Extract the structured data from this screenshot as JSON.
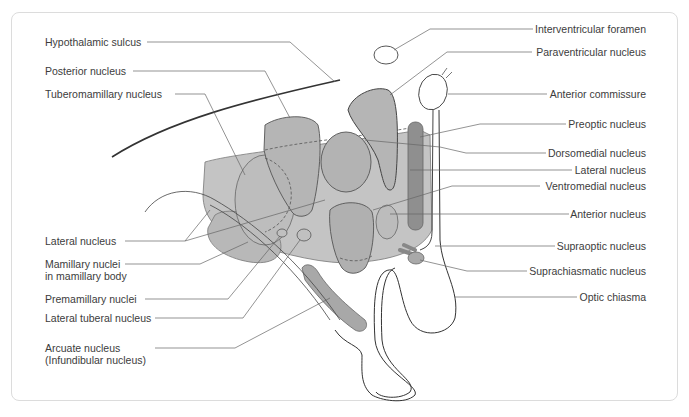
{
  "colors": {
    "background": "#ffffff",
    "frame_border": "#dcdcdc",
    "nucleus_fill": "#b5b5b5",
    "nucleus_fill_light": "#c4c4c4",
    "nucleus_dark": "#8a8a8a",
    "outline": "#4a4a4a",
    "leader_line": "#666666",
    "label_text": "#3c3c3c"
  },
  "labels_left": [
    {
      "id": "hypothalamic-sulcus",
      "text": "Hypothalamic sulcus"
    },
    {
      "id": "posterior-nucleus",
      "text": "Posterior nucleus"
    },
    {
      "id": "tuberomamillary-nucleus",
      "text": "Tuberomamillary nucleus"
    },
    {
      "id": "lateral-nucleus-left",
      "text": "Lateral nucleus"
    },
    {
      "id": "mamillary-nuclei",
      "text": "Mamillary nuclei",
      "text2": "in mamillary body"
    },
    {
      "id": "premamillary-nuclei",
      "text": "Premamillary nuclei"
    },
    {
      "id": "lateral-tuberal-nucleus",
      "text": "Lateral tuberal nucleus"
    },
    {
      "id": "arcuate-nucleus",
      "text": "Arcuate nucleus",
      "text2": "(Infundibular nucleus)"
    }
  ],
  "labels_right": [
    {
      "id": "interventricular-foramen",
      "text": "Interventricular foramen"
    },
    {
      "id": "paraventricular-nucleus",
      "text": "Paraventricular nucleus"
    },
    {
      "id": "anterior-commissure",
      "text": "Anterior commissure"
    },
    {
      "id": "preoptic-nucleus",
      "text": "Preoptic nucleus"
    },
    {
      "id": "dorsomedial-nucleus",
      "text": "Dorsomedial nucleus"
    },
    {
      "id": "lateral-nucleus-right",
      "text": "Lateral nucleus"
    },
    {
      "id": "ventromedial-nucleus",
      "text": "Ventromedial nucleus"
    },
    {
      "id": "anterior-nucleus",
      "text": "Anterior nucleus"
    },
    {
      "id": "supraoptic-nucleus",
      "text": "Supraoptic nucleus"
    },
    {
      "id": "suprachiasmatic-nucleus",
      "text": "Suprachiasmatic nucleus"
    },
    {
      "id": "optic-chiasma",
      "text": "Optic chiasma"
    }
  ]
}
